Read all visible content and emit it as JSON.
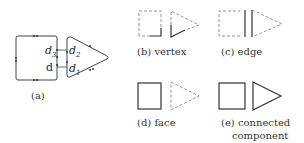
{
  "panels": {
    "a": {
      "caption": "(a)",
      "labels": {
        "d3_base": "d",
        "d3_sub": "3",
        "d": "d",
        "d2_base": "d",
        "d2_sub": "2",
        "d1_base": "d",
        "d1_sub": "1"
      }
    },
    "b": {
      "caption": "(b) vertex"
    },
    "c": {
      "caption": "(c) edge"
    },
    "d": {
      "caption": "(d) face"
    },
    "e": {
      "caption_line1": "(e) connected",
      "caption_line2": "component"
    }
  },
  "colors": {
    "stroke": "#333333",
    "dashed": "#777777",
    "background": "#ffffff"
  }
}
